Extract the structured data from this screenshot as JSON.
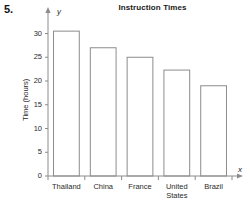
{
  "problem": {
    "number": "5."
  },
  "axis_letters": {
    "y": "y",
    "x": "x"
  },
  "chart_data": {
    "type": "bar",
    "title": "Instruction Times",
    "xlabel": "",
    "ylabel": "Time (hours)",
    "categories": [
      "Thailand",
      "China",
      "France",
      "United\nStates",
      "Brazil"
    ],
    "values": [
      30.5,
      27,
      25,
      22.3,
      19
    ],
    "ylim": [
      0,
      32
    ],
    "yticks": [
      0,
      5,
      10,
      15,
      20,
      25,
      30
    ],
    "ytick_labels": [
      "0",
      "5",
      "10",
      "15",
      "20",
      "25",
      "30"
    ],
    "grid": false,
    "legend": null,
    "bar_fill": "#ffffff",
    "bar_stroke": "#8c8c8c",
    "axis_color": "#8c8c8c"
  }
}
